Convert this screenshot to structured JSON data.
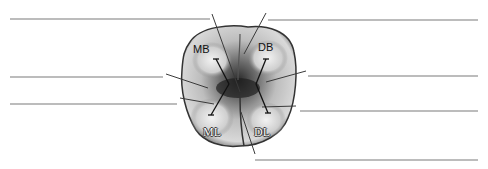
{
  "diagram": {
    "cusp_labels": {
      "mb": "MB",
      "db": "DB",
      "ml": "ML",
      "dl": "DL"
    },
    "blank_label_lines": [
      {
        "side": "left",
        "index": 1
      },
      {
        "side": "left",
        "index": 2
      },
      {
        "side": "left",
        "index": 3
      },
      {
        "side": "right",
        "index": 1
      },
      {
        "side": "right",
        "index": 2
      },
      {
        "side": "right",
        "index": 3
      },
      {
        "side": "right",
        "index": 4
      }
    ],
    "colors": {
      "line": "#7a7a7a",
      "leader": "#444444",
      "enamel_light": "#e6e6e6",
      "enamel_dark": "#3a3a3a"
    }
  }
}
